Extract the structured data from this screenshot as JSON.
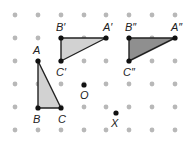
{
  "diagram": {
    "type": "dot-grid-transformations",
    "grid": {
      "columns_x": [
        15,
        38,
        61,
        84,
        106,
        129,
        152,
        175
      ],
      "rows_y": [
        15,
        38,
        61,
        84,
        107,
        130
      ],
      "dot_color": "#b8b8b8",
      "dot_radius": 2.4
    },
    "colors": {
      "edge": "#222222",
      "vertex": "#111111",
      "fill_light": "#d2d2d2",
      "fill_dark": "#8f8f8f"
    },
    "triangles": [
      {
        "id": "ABC",
        "fill": "light",
        "vertices": [
          {
            "label": "A",
            "x": 38,
            "y": 61,
            "lx": 33,
            "ly": 54
          },
          {
            "label": "B",
            "x": 38,
            "y": 108,
            "lx": 33,
            "ly": 123
          },
          {
            "label": "C",
            "x": 61,
            "y": 108,
            "lx": 58,
            "ly": 123
          }
        ]
      },
      {
        "id": "A'B'C'",
        "fill": "light",
        "vertices": [
          {
            "label": "A′",
            "x": 106,
            "y": 38,
            "lx": 103,
            "ly": 31
          },
          {
            "label": "B′",
            "x": 61,
            "y": 38,
            "lx": 56,
            "ly": 31
          },
          {
            "label": "C′",
            "x": 61,
            "y": 61,
            "lx": 56,
            "ly": 76
          }
        ]
      },
      {
        "id": "A''B''C''",
        "fill": "dark",
        "vertices": [
          {
            "label": "A″",
            "x": 175,
            "y": 38,
            "lx": 171,
            "ly": 31
          },
          {
            "label": "B″",
            "x": 129,
            "y": 38,
            "lx": 125,
            "ly": 31
          },
          {
            "label": "C″",
            "x": 129,
            "y": 61,
            "lx": 123,
            "ly": 76
          }
        ]
      }
    ],
    "points": [
      {
        "label": "O",
        "x": 84,
        "y": 85,
        "lx": 80,
        "ly": 99
      },
      {
        "label": "X",
        "x": 116,
        "y": 113,
        "lx": 111,
        "ly": 127
      }
    ]
  }
}
